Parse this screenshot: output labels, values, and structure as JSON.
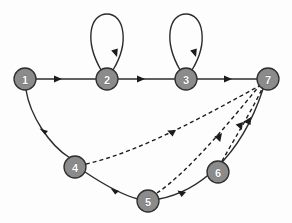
{
  "figure": {
    "background_color": "#fdfdfd",
    "width": 292,
    "height": 223
  },
  "style": {
    "node_fill": "#8b8b8b",
    "node_stroke": "#2e2e2e",
    "node_label_color": "#ffffff",
    "edge_color": "#2b2b2b",
    "dashed_edge_color": "#1e1e1e"
  },
  "nodes": [
    {
      "id": "1",
      "label": "1",
      "cx": 25,
      "cy": 79,
      "r": 11
    },
    {
      "id": "2",
      "label": "2",
      "cx": 107,
      "cy": 79,
      "r": 11
    },
    {
      "id": "3",
      "label": "3",
      "cx": 186,
      "cy": 79,
      "r": 11
    },
    {
      "id": "4",
      "label": "4",
      "cx": 75,
      "cy": 167,
      "r": 11
    },
    {
      "id": "5",
      "label": "5",
      "cx": 148,
      "cy": 201,
      "r": 11
    },
    {
      "id": "6",
      "label": "6",
      "cx": 218,
      "cy": 172,
      "r": 11
    },
    {
      "id": "7",
      "label": "7",
      "cx": 268,
      "cy": 79,
      "r": 11
    }
  ],
  "edges": [
    {
      "id": "e-1-2",
      "from": "1",
      "to": "2",
      "style": "solid",
      "kind": "straight"
    },
    {
      "id": "e-2-2",
      "from": "2",
      "to": "2",
      "style": "solid",
      "kind": "self-loop"
    },
    {
      "id": "e-2-3",
      "from": "2",
      "to": "3",
      "style": "solid",
      "kind": "straight"
    },
    {
      "id": "e-3-3",
      "from": "3",
      "to": "3",
      "style": "solid",
      "kind": "self-loop"
    },
    {
      "id": "e-3-7",
      "from": "3",
      "to": "7",
      "style": "solid",
      "kind": "straight"
    },
    {
      "id": "e-1-4",
      "from": "1",
      "to": "4",
      "style": "solid",
      "kind": "curve"
    },
    {
      "id": "e-4-5",
      "from": "4",
      "to": "5",
      "style": "solid",
      "kind": "curve"
    },
    {
      "id": "e-5-7",
      "from": "5",
      "to": "7",
      "style": "solid",
      "kind": "curve"
    },
    {
      "id": "e-4-7",
      "from": "4",
      "to": "7",
      "style": "dashed",
      "kind": "curve"
    },
    {
      "id": "e-5-7d",
      "from": "5",
      "to": "7",
      "style": "dashed",
      "kind": "curve"
    },
    {
      "id": "e-6-7",
      "from": "6",
      "to": "7",
      "style": "dashed",
      "kind": "curve"
    }
  ],
  "labels": {
    "node_1": "1",
    "node_2": "2",
    "node_3": "3",
    "node_4": "4",
    "node_5": "5",
    "node_6": "6",
    "node_7": "7"
  }
}
